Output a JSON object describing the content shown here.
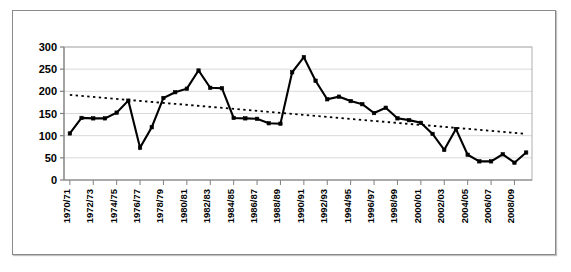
{
  "chart_data": {
    "type": "line",
    "title": "",
    "subtitle": "",
    "xlabel": "",
    "ylabel": "",
    "ylim": [
      0,
      300
    ],
    "ytick_step": 50,
    "yticks": [
      "0",
      "50",
      "100",
      "150",
      "200",
      "250",
      "300"
    ],
    "grid": true,
    "grid_axis": "y",
    "legend": "none",
    "marker": "square",
    "line_color": "#000000",
    "marker_color": "#000000",
    "trendline": {
      "type": "linear-dotted",
      "style": "dotted",
      "color": "#000000",
      "start_value": 192,
      "end_value": 104
    },
    "categories": [
      "1970/71",
      "1971/72",
      "1972/73",
      "1973/74",
      "1974/75",
      "1975/76",
      "1976/77",
      "1977/78",
      "1978/79",
      "1979/80",
      "1980/81",
      "1981/82",
      "1982/83",
      "1983/84",
      "1984/85",
      "1985/86",
      "1986/87",
      "1987/88",
      "1988/89",
      "1989/90",
      "1990/91",
      "1991/92",
      "1992/93",
      "1993/94",
      "1994/95",
      "1995/96",
      "1996/97",
      "1997/98",
      "1998/99",
      "1999/00",
      "2000/01",
      "2001/02",
      "2002/03",
      "2003/04",
      "2004/05",
      "2005/06",
      "2006/07",
      "2007/08",
      "2008/09",
      "2009/10"
    ],
    "xtick_labels": [
      "1970/71",
      "1972/73",
      "1974/75",
      "1976/77",
      "1978/79",
      "1980/81",
      "1982/83",
      "1984/85",
      "1986/87",
      "1988/89",
      "1990/91",
      "1992/93",
      "1994/95",
      "1996/97",
      "1998/99",
      "2000/01",
      "2002/03",
      "2004/05",
      "2006/07",
      "2008/09"
    ],
    "xtick_indices": [
      0,
      2,
      4,
      6,
      8,
      10,
      12,
      14,
      16,
      18,
      20,
      22,
      24,
      26,
      28,
      30,
      32,
      34,
      36,
      38
    ],
    "values": [
      105,
      140,
      139,
      139,
      152,
      179,
      73,
      119,
      185,
      198,
      206,
      247,
      208,
      207,
      140,
      139,
      138,
      128,
      127,
      243,
      277,
      224,
      182,
      188,
      178,
      171,
      151,
      163,
      139,
      135,
      129,
      104,
      68,
      115,
      57,
      42,
      42,
      58,
      39,
      62
    ],
    "series_name": ""
  },
  "figure": {
    "background_color": "#ffffff",
    "frame_color": "#8a8a8a",
    "plot_border_color": "#b0b0b0",
    "gridline_color": "#d9d9d9",
    "axis_color": "#808080"
  }
}
